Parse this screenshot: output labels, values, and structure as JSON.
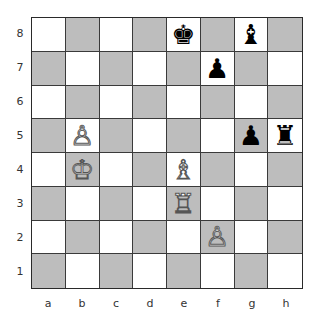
{
  "board": {
    "files": [
      "a",
      "b",
      "c",
      "d",
      "e",
      "f",
      "g",
      "h"
    ],
    "ranks": [
      "8",
      "7",
      "6",
      "5",
      "4",
      "3",
      "2",
      "1"
    ],
    "colors": {
      "light": "#ffffff",
      "dark": "#bdbdbd"
    },
    "pieces": [
      {
        "square": "e8",
        "color": "black",
        "type": "king",
        "glyph": "♚"
      },
      {
        "square": "g8",
        "color": "black",
        "type": "bishop",
        "glyph": "♝"
      },
      {
        "square": "f7",
        "color": "black",
        "type": "pawn",
        "glyph": "♟"
      },
      {
        "square": "g5",
        "color": "black",
        "type": "pawn",
        "glyph": "♟"
      },
      {
        "square": "h5",
        "color": "black",
        "type": "rook",
        "glyph": "♜"
      },
      {
        "square": "b5",
        "color": "white",
        "type": "pawn",
        "glyph": "♙"
      },
      {
        "square": "b4",
        "color": "white",
        "type": "king",
        "glyph": "♔"
      },
      {
        "square": "e4",
        "color": "white",
        "type": "bishop",
        "glyph": "♗"
      },
      {
        "square": "e3",
        "color": "white",
        "type": "rook",
        "glyph": "♖"
      },
      {
        "square": "f2",
        "color": "white",
        "type": "pawn",
        "glyph": "♙"
      }
    ]
  }
}
